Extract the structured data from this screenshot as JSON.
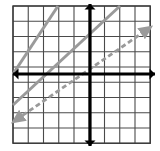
{
  "figure": {
    "title": "",
    "width": 160,
    "height": 151,
    "background_color": "#ffffff"
  },
  "grid": {
    "label": "square-grid",
    "columns": 9,
    "rows": 9,
    "x_start": 13,
    "y_start": 6,
    "cell_size": 15.25,
    "line_color": "#4a4a4a",
    "line_width": 1.1,
    "border_color": "#3a3a3a",
    "border_width": 1.4
  },
  "axes": {
    "color": "#000000",
    "width": 3.2,
    "arrow_size": 5.5,
    "x_axis": {
      "label": "x-axis",
      "y_position": 74,
      "x_from": 13,
      "x_to": 155,
      "arrow_left": true,
      "arrow_right": true
    },
    "y_axis": {
      "label": "y-axis",
      "x_position": 90,
      "y_from": 4,
      "y_to": 146,
      "arrow_up": true,
      "arrow_down": true
    },
    "origin": {
      "x": 90,
      "y": 74
    }
  },
  "chart_data": {
    "type": "line",
    "title": "",
    "xlabel": "",
    "ylabel": "",
    "xlim": [
      -5,
      4
    ],
    "ylim": [
      -5,
      4
    ],
    "grid": true,
    "legend": "none",
    "series": [
      {
        "name": "solid-line-upper-left",
        "style": "solid",
        "color": "#9a9a9a",
        "width": 3.0,
        "slope": 1,
        "intercept": 5,
        "pixel_start": {
          "x": 13,
          "y": 74
        },
        "pixel_end": {
          "x": 58,
          "y": 6
        },
        "arrow_start": false,
        "arrow_end": false
      },
      {
        "name": "solid-line-main",
        "style": "solid",
        "color": "#9a9a9a",
        "width": 3.0,
        "slope": 1,
        "intercept": 3,
        "pixel_start": {
          "x": 13,
          "y": 105
        },
        "pixel_end": {
          "x": 120,
          "y": 6
        },
        "arrow_start": false,
        "arrow_end": false
      },
      {
        "name": "dashed-line",
        "style": "dashed",
        "color": "#9a9a9a",
        "width": 2.8,
        "dash_pattern": "5 3",
        "slope": 0.7,
        "intercept": -1,
        "pixel_start": {
          "x": 16,
          "y": 120
        },
        "pixel_end": {
          "x": 148,
          "y": 29
        },
        "arrow_start": true,
        "arrow_end": true
      }
    ]
  }
}
